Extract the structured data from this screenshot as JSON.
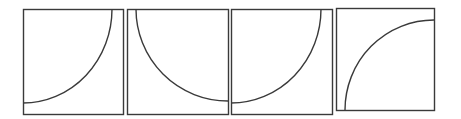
{
  "diagram": {
    "stroke_color": "#3a3a3a",
    "background": "#ffffff",
    "panels": [
      {
        "id": "panel-1",
        "box": {
          "x": 23,
          "y": 9,
          "w": 100,
          "h": 105
        },
        "arc": {
          "from": [
            23,
            103
          ],
          "to": [
            112,
            9
          ],
          "center_corner": "top-left",
          "path": "M23,103 A89,94 0 0 0 112,9"
        }
      },
      {
        "id": "panel-2",
        "box": {
          "x": 127,
          "y": 9,
          "w": 101,
          "h": 105
        },
        "arc": {
          "from": [
            136,
            9
          ],
          "to": [
            228,
            101
          ],
          "center_corner": "top-right",
          "path": "M136,9 A92,92 0 0 0 228,101"
        }
      },
      {
        "id": "panel-3",
        "box": {
          "x": 231,
          "y": 9,
          "w": 101,
          "h": 105
        },
        "arc": {
          "from": [
            231,
            103
          ],
          "to": [
            321,
            9
          ],
          "center_corner": "top-left",
          "path": "M231,103 A90,94 0 0 0 321,9"
        }
      },
      {
        "id": "panel-4",
        "box": {
          "x": 336,
          "y": 8,
          "w": 98,
          "h": 102
        },
        "arc": {
          "from": [
            345,
            110
          ],
          "to": [
            434,
            20
          ],
          "center_corner": "bottom-right",
          "path": "M345,110 A89,90 0 0 1 434,20"
        }
      }
    ]
  }
}
